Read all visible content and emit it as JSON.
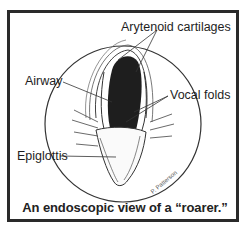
{
  "figure": {
    "labels": {
      "arytenoid": "Arytenoid cartilages",
      "airway": "Airway",
      "vocal_folds": "Vocal folds",
      "epiglottis": "Epiglottis"
    },
    "signature": "P. Patterson",
    "caption": "An endoscopic view of a “roarer.”"
  }
}
